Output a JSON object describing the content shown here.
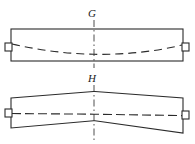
{
  "figure": {
    "type": "engineering-drawing",
    "background_color": "#ffffff",
    "line_color": "#2b2b2b",
    "panels": [
      {
        "id": "panel-g",
        "label": "G",
        "label_x": 88,
        "label_y": 17,
        "centerline": {
          "x": 94,
          "y_top": 20,
          "y_bottom": 68
        },
        "outline": {
          "left": 11,
          "right": 183,
          "top": 29,
          "bottom": 61
        },
        "left_tab": {
          "x": 5,
          "y": 43,
          "width": 7,
          "height": 8
        },
        "right_tab": {
          "x": 182,
          "y": 43,
          "width": 7,
          "height": 8
        },
        "deflection_curve": "M 12 44 Q 55 53 94 54 Q 140 55 182 45",
        "deflection_style": "dashed",
        "shape_note": "straight rectangular beam with sagging dashed deflection curve"
      },
      {
        "id": "panel-h",
        "label": "H",
        "label_x": 88,
        "label_y": 82,
        "centerline": {
          "x": 94,
          "y_top": 85,
          "y_bottom": 140
        },
        "outline_points": "11,98 94,92 96,92 183,98 183,133 96,121 94,121 11,128",
        "left_edge": {
          "x": 11,
          "y_top": 98,
          "y_bottom": 128
        },
        "right_edge": {
          "x": 183,
          "y_top": 98,
          "y_bottom": 133
        },
        "left_tab": {
          "x": 5,
          "y": 110,
          "width": 7,
          "height": 8
        },
        "right_tab": {
          "x": 182,
          "y": 112,
          "width": 7,
          "height": 8
        },
        "deflection_curve": "M 12 114 L 94 114 L 183 116",
        "deflection_style": "dash-dot",
        "shape_note": "two tapered beam segments meeting at a peak at the centre"
      }
    ]
  }
}
